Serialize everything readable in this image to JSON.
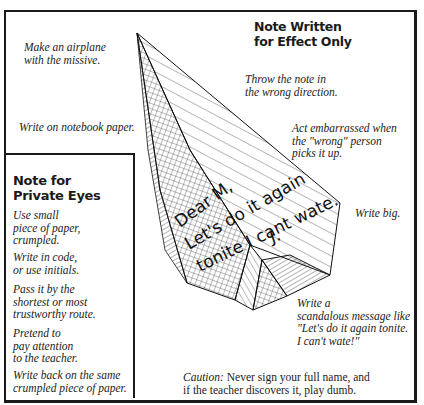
{
  "figure": {
    "panels": {
      "effect": {
        "title_lines": [
          "Note Written",
          "for Effect Only"
        ]
      },
      "private": {
        "title_lines": [
          "Note for",
          "Private Eyes"
        ],
        "tips": [
          {
            "lines": [
              "Use small",
              "piece of paper,",
              "crumpled."
            ]
          },
          {
            "lines": [
              "Write in code,",
              "or use initials."
            ]
          },
          {
            "lines": [
              "Pass it by the",
              "shortest or most",
              "trustworthy route."
            ]
          },
          {
            "lines": [
              "Pretend to",
              "pay attention",
              "to the teacher."
            ]
          },
          {
            "lines": [
              "Write back on the same",
              "crumpled piece of paper."
            ]
          }
        ]
      }
    },
    "annotations": {
      "airplane": [
        "Make an airplane",
        "with the missive."
      ],
      "notebook": [
        "Write on notebook paper."
      ],
      "throw": [
        "Throw the note in",
        "the wrong direction."
      ],
      "embarrassed": [
        "Act embarrassed when",
        "the \"wrong\" person",
        "picks it up."
      ],
      "big": [
        "Write big."
      ],
      "scandalous": [
        "Write a",
        "scandalous message like",
        "\"Let's do it again tonite.",
        "I can't wate!\""
      ],
      "caution_label": "Caution:",
      "caution_rest_line1": " Never sign your full name, and",
      "caution_line2": "if the teacher discovers it, play dumb."
    },
    "handwritten_note": {
      "lines": [
        "Dear M,",
        "Let's do it again",
        "tonite I cant wate.",
        "J."
      ]
    },
    "colors": {
      "ink": "#1a1a1a",
      "paper": "#ffffff"
    }
  }
}
